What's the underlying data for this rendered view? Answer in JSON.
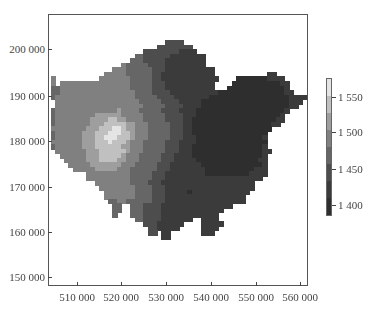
{
  "chart_data": {
    "type": "heatmap",
    "title": "",
    "xlabel": "",
    "ylabel": "",
    "x_ticks": [
      {
        "value": 510000,
        "label": "510 000"
      },
      {
        "value": 520000,
        "label": "520 000"
      },
      {
        "value": 530000,
        "label": "530 000"
      },
      {
        "value": 540000,
        "label": "540 000"
      },
      {
        "value": 550000,
        "label": "550 000"
      },
      {
        "value": 560000,
        "label": "560 000"
      }
    ],
    "y_ticks": [
      {
        "value": 150000,
        "label": "150 000"
      },
      {
        "value": 160000,
        "label": "160 000"
      },
      {
        "value": 170000,
        "label": "170 000"
      },
      {
        "value": 180000,
        "label": "180 000"
      },
      {
        "value": 190000,
        "label": "190 000"
      },
      {
        "value": 200000,
        "label": "200 000"
      }
    ],
    "xlim": [
      503500,
      562000
    ],
    "ylim": [
      148000,
      207700
    ],
    "grid": false,
    "colorbar": {
      "position": "right",
      "range": [
        1380,
        1580
      ],
      "ticks": [
        {
          "value": 1400,
          "label": "1 400"
        },
        {
          "value": 1450,
          "label": "1 450"
        },
        {
          "value": 1500,
          "label": "1 500"
        },
        {
          "value": 1550,
          "label": "1 550"
        }
      ],
      "colormap": "grayscale (dark = low, light = high)"
    },
    "cell_size_m": 1000,
    "grid_origin": {
      "x_min": 504000,
      "y_top": 202000
    },
    "band_values": {
      "0": 1390,
      "1": 1420,
      "2": 1445,
      "3": 1470,
      "4": 1495,
      "5": 1520,
      "6": 1545,
      "7": 1570
    },
    "band_colors": {
      "0": "#2e2e2e",
      "1": "#3b3b3b",
      "2": "#4d4d4d",
      "3": "#666666",
      "4": "#808080",
      "5": "#9e9e9e",
      "6": "#c0c0c0",
      "7": "#e4e4e4"
    },
    "rows": [
      "..........................2222............................",
      "........................22222222..........................",
      ".....................222222221111.........................",
      "...................3322222211111111.......................",
      "..................33322222111111111.......................",
      "................4333332222111111111.......................",
      "..............44433333322211111111111.....................",
      "............4444433333322111111111111............11.......",
      "4..........444444433333221111111111111....00000001111.....",
      "4.44444444444444443333322211111111111....0000000000011....",
      "3344444444444444443333322211111111111...00000000000001....",
      "3344444444444444444333322221111111111100000000000000011...",
      "3444444444444444444333332222111111110000000000000000001111",
      ".44444444444444444443333322221111100000000000000000000111.",
      ".4444444444444444444433333222211110000000000000000000011..",
      "344444444444444544443333322221111000000000000000000001....",
      "34444444445555554444433333222211100000000000000000001.....",
      "34444444455556655444433333222211000000000000000000011.....",
      "3444444445556666655444333332221100000000000000000011......",
      "44444444555666776554443333322211000000000000000000........",
      "3444444555666777665444333332221100000000000000000.........",
      "3444444555667776665444333332221110000000000000001.........",
      "4444444555666766654443333322211110000000000000000.........",
      "3444444555666666554443333322211100000000000000001.........",
      ".4444444555666666544433333222111000000000000000011........",
      "..44444455566666544433333222111100000000000000001.........",
      "...4444455566665544433333222111110000000000000011.........",
      "....444445555555444333332221111111000000000000001.........",
      ".....44444555554443333332221111111100000000000111.........",
      "........44444444443333322211111111100000000001111.........",
      "........4444444444333332221111111111111111111111..........",
      "..........444444443333222111111111111111111111...........",
      "...........44444444333322211111111111111111111...........",
      "............444444433332221111101111111111111............",
      "............44444443333222111111111111111111.............",
      ".............3344333333222111111111111111111.............",
      "..............33..33322221111111111111111................",
      "..............33..333222211111111111111..................",
      "..............3...33322221111111111111...................",
      "...................3322221111111..1111...................",
      ".....................222111111....11111..................",
      "......................2211111.....1111...................",
      "......................22.11.......111....................",
      ".........................11.......................... ...",
      "........................................................."
    ]
  }
}
